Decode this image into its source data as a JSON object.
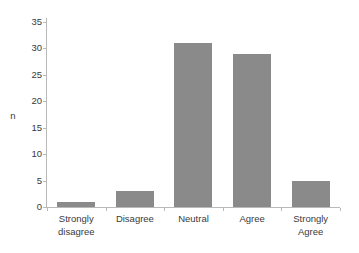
{
  "chart_data": {
    "type": "bar",
    "title": "",
    "xlabel": "",
    "ylabel": "n",
    "categories": [
      "Strongly disagree",
      "Disagree",
      "Neutral",
      "Agree",
      "Strongly Agree"
    ],
    "category_lines": [
      [
        "Strongly",
        "disagree"
      ],
      [
        "Disagree",
        ""
      ],
      [
        "Neutral",
        ""
      ],
      [
        "Agree",
        ""
      ],
      [
        "Strongly",
        "Agree"
      ]
    ],
    "values": [
      1,
      3,
      31,
      29,
      5
    ],
    "ylim": [
      0,
      35
    ],
    "ytick_labels": [
      "35",
      "30",
      "25",
      "20",
      "15",
      "10",
      "5",
      "0"
    ],
    "ytick_values": [
      35,
      30,
      25,
      20,
      15,
      10,
      5,
      0
    ],
    "grid": false,
    "legend": null,
    "bar_color": "#8a8a8a",
    "axis_color": "#b9b9b9",
    "text_color": "#3a3a3a",
    "background_color": "#ffffff"
  }
}
